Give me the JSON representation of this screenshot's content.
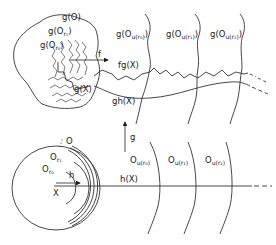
{
  "diagram": {
    "top": {
      "blob_labels": {
        "g_O": "g(O)",
        "g_Or1": "g(O",
        "g_Or1_sub": "r₁",
        "g_Or0": "g(O",
        "g_Or0_sub": "r₀",
        "g_X": "g(X)"
      },
      "map_f": "f",
      "curve_labels": {
        "fgX": "fg(X)",
        "ghX": "gh(X)"
      },
      "column_labels": [
        {
          "main": "g(O",
          "sub": "u(r₀)",
          "close": ")"
        },
        {
          "main": "g(O",
          "sub": "u(r₁)",
          "close": ")"
        },
        {
          "main": "g(O",
          "sub": "u(r₂)",
          "close": ")"
        }
      ]
    },
    "map_g": "g",
    "bottom": {
      "disk_labels": {
        "O": "O",
        "Or1": "O",
        "Or1_sub": "r₁",
        "Or0": "O",
        "Or0_sub": "r₀",
        "h": "h",
        "X": "X"
      },
      "line_label": "h(X)",
      "column_labels": [
        {
          "main": "O",
          "sub": "u(r₀)"
        },
        {
          "main": "O",
          "sub": "u(r₁)"
        },
        {
          "main": "O",
          "sub": "u(r₂)"
        }
      ]
    }
  }
}
